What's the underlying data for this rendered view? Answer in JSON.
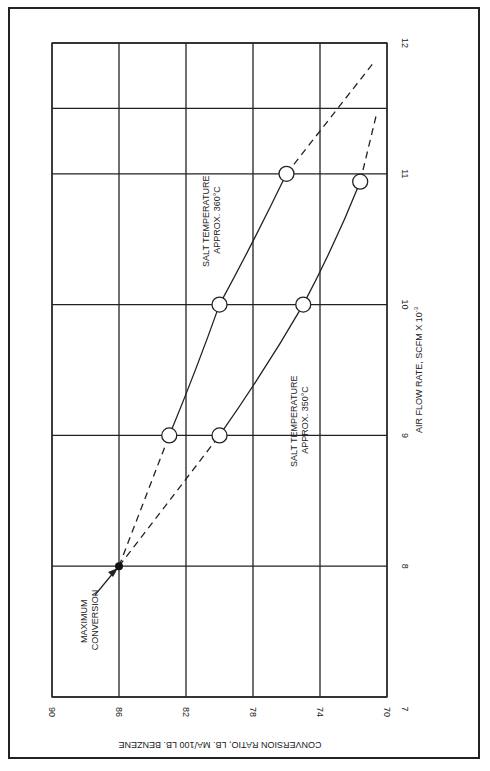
{
  "chart_data": {
    "type": "line",
    "orientation": "rotated 90 degrees clockwise on page",
    "title": "",
    "xlabel": "AIR FLOW RATE, SCFM X 10^-3",
    "xlabel_main": "AIR FLOW RATE, SCFM X 10",
    "xlabel_sup": "-3",
    "ylabel": "CONVERSION RATIO, LB. MA/100 LB. BENZENE",
    "xlim": [
      7,
      12
    ],
    "ylim": [
      70,
      90
    ],
    "y_reversed_on_page": true,
    "x_ticks": [
      "7",
      "8",
      "9",
      "10",
      "11",
      "12"
    ],
    "y_ticks": [
      "90",
      "86",
      "82",
      "78",
      "74",
      "70"
    ],
    "grid": true,
    "series": [
      {
        "name": "SALT TEMPERATURE APPROX. 360°C",
        "label_line1": "SALT TEMPERATURE",
        "label_line2": "APPROX. 360°C",
        "points": [
          {
            "x": 9,
            "y": 83
          },
          {
            "x": 10,
            "y": 80
          },
          {
            "x": 11,
            "y": 76
          }
        ],
        "extrapolation_dashed": [
          {
            "x": 8,
            "y": 86
          },
          {
            "x": 9,
            "y": 83
          },
          {
            "x": 11,
            "y": 76
          },
          {
            "x": 11.85,
            "y": 70.8
          }
        ]
      },
      {
        "name": "SALT TEMPERATURE APPROX. 350°C",
        "label_line1": "SALT TEMPERATURE",
        "label_line2": "APPROX. 350°C",
        "points": [
          {
            "x": 9,
            "y": 80
          },
          {
            "x": 10,
            "y": 75
          },
          {
            "x": 10.94,
            "y": 71.6
          }
        ],
        "extrapolation_dashed": [
          {
            "x": 8,
            "y": 86
          },
          {
            "x": 9,
            "y": 80
          },
          {
            "x": 10.94,
            "y": 71.6
          },
          {
            "x": 11.47,
            "y": 70.6
          }
        ]
      }
    ],
    "annotations": [
      {
        "text": "MAXIMUM CONVERSION",
        "line1": "MAXIMUM",
        "line2": "CONVERSION",
        "x": 8,
        "y": 86,
        "marker": "filled-dot",
        "arrow": true
      }
    ]
  }
}
